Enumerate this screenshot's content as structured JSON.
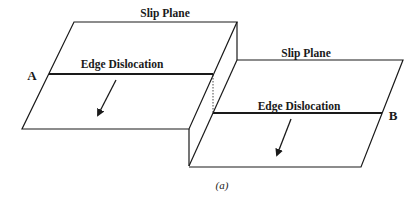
{
  "figure": {
    "caption": "(a)",
    "colors": {
      "stroke": "#1a1a1a",
      "background": "#ffffff"
    }
  },
  "left_slab": {
    "plane_label": "Slip Plane",
    "dislocation_label": "Edge Dislocation",
    "end_label": "A"
  },
  "right_slab": {
    "plane_label": "Slip Plane",
    "dislocation_label": "Edge Dislocation",
    "end_label": "B"
  }
}
